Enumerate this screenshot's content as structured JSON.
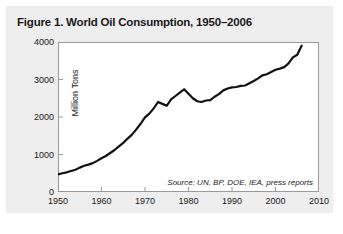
{
  "figure": {
    "title": "Figure 1. World Oil Consumption, 1950–2006",
    "source_note": "Source: UN, BP, DOE, IEA, press reports",
    "card_background": "#eeeeee",
    "line_color": "#111111",
    "frame_color": "#9a9a9a"
  },
  "chart_data": {
    "type": "line",
    "title": "Figure 1. World Oil Consumption, 1950–2006",
    "xlabel": "",
    "ylabel": "Million Tons",
    "xlim": [
      1950,
      2010
    ],
    "ylim": [
      0,
      4000
    ],
    "xticks": [
      1950,
      1960,
      1970,
      1980,
      1990,
      2000,
      2010
    ],
    "yticks": [
      0,
      1000,
      2000,
      3000,
      4000
    ],
    "grid": false,
    "legend": "none",
    "annotations": [
      "Source: UN, BP, DOE, IEA, press reports"
    ],
    "series": [
      {
        "name": "World Oil Consumption",
        "x": [
          1950,
          1951,
          1952,
          1953,
          1954,
          1955,
          1956,
          1957,
          1958,
          1959,
          1960,
          1961,
          1962,
          1963,
          1964,
          1965,
          1966,
          1967,
          1968,
          1969,
          1970,
          1971,
          1972,
          1973,
          1974,
          1975,
          1976,
          1977,
          1978,
          1979,
          1980,
          1981,
          1982,
          1983,
          1984,
          1985,
          1986,
          1987,
          1988,
          1989,
          1990,
          1991,
          1992,
          1993,
          1994,
          1995,
          1996,
          1997,
          1998,
          1999,
          2000,
          2001,
          2002,
          2003,
          2004,
          2005,
          2006
        ],
        "values": [
          470,
          500,
          525,
          560,
          595,
          650,
          700,
          730,
          770,
          830,
          900,
          960,
          1040,
          1120,
          1215,
          1310,
          1425,
          1530,
          1670,
          1820,
          1990,
          2090,
          2230,
          2400,
          2350,
          2300,
          2470,
          2560,
          2650,
          2740,
          2620,
          2500,
          2420,
          2400,
          2440,
          2450,
          2540,
          2610,
          2710,
          2760,
          2790,
          2800,
          2830,
          2840,
          2900,
          2960,
          3030,
          3110,
          3140,
          3200,
          3260,
          3290,
          3330,
          3430,
          3590,
          3660,
          3900
        ]
      }
    ]
  }
}
